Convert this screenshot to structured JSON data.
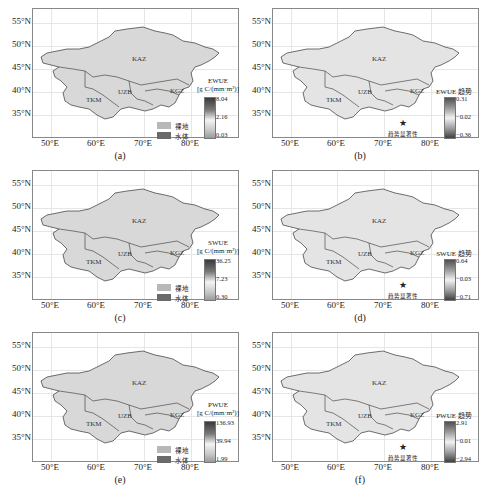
{
  "axes": {
    "y_ticks": [
      "55°N",
      "50°N",
      "45°N",
      "40°N",
      "35°N"
    ],
    "x_ticks": [
      "50°E",
      "60°E",
      "70°E",
      "80°E"
    ]
  },
  "countries": [
    "KAZ",
    "UZB",
    "TKM",
    "KGZ"
  ],
  "land_legend": {
    "bare_land": "裸地",
    "water_body": "水体",
    "bare_color": "#b8b8b8",
    "water_color": "#6a6a6a"
  },
  "significance_label": "趋势显著性",
  "panels": [
    {
      "id": "a",
      "caption": "(a)",
      "legend_title": "EWUE",
      "legend_unit": "[g C/(mm·m²)]",
      "ticks": [
        "8.04",
        "2.16",
        "0.03"
      ],
      "type": "absolute"
    },
    {
      "id": "b",
      "caption": "(b)",
      "legend_title": "EWUE 趋势",
      "ticks": [
        "0.31",
        "−0.02",
        "−0.36"
      ],
      "type": "trend"
    },
    {
      "id": "c",
      "caption": "(c)",
      "legend_title": "SWUE",
      "legend_unit": "[g C/(mm·m²)]",
      "ticks": [
        "36.25",
        "7.23",
        "0.30"
      ],
      "type": "absolute"
    },
    {
      "id": "d",
      "caption": "(d)",
      "legend_title": "SWUE 趋势",
      "ticks": [
        "0.64",
        "−0.03",
        "−0.71"
      ],
      "type": "trend"
    },
    {
      "id": "e",
      "caption": "(e)",
      "legend_title": "PWUE",
      "legend_unit": "[g C/(mm·m²)]",
      "ticks": [
        "136.93",
        "39.94",
        "1.99"
      ],
      "type": "absolute"
    },
    {
      "id": "f",
      "caption": "(f)",
      "legend_title": "PWUE 趋势",
      "ticks": [
        "2.91",
        "−0.01",
        "−2.94"
      ],
      "type": "trend"
    }
  ]
}
